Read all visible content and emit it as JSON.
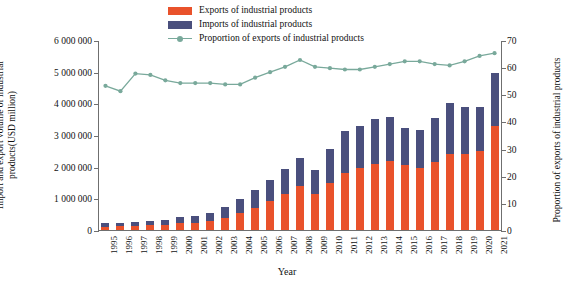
{
  "legend": {
    "items": [
      {
        "label": "Exports of industrial products",
        "type": "swatch",
        "color": "#e9522b"
      },
      {
        "label": "Imports of industrial products",
        "type": "swatch",
        "color": "#4a4f7d"
      },
      {
        "label": "Proportion of exports of industrial products",
        "type": "line",
        "color": "#79a99b"
      }
    ]
  },
  "axes": {
    "y_left_title": "Import and export volume of industrial products(USD million)",
    "y_right_title": "Proportion of exports of industrial products",
    "x_title": "Year",
    "y_left_ticks": [
      "0",
      "1 000 000",
      "2 000 000",
      "3 000 000",
      "4 000 000",
      "5 000 000",
      "6 000 000"
    ],
    "y_right_ticks": [
      "0",
      "10",
      "20",
      "30",
      "40",
      "50",
      "60",
      "70"
    ]
  },
  "chart_data": {
    "type": "bar",
    "title": "",
    "xlabel": "Year",
    "ylabel": "Import and export volume of industrial products(USD million)",
    "y2label": "Proportion of exports of industrial products",
    "ylim": [
      0,
      6000000
    ],
    "y2lim": [
      0,
      70
    ],
    "grid": false,
    "legend_position": "top-center",
    "categories": [
      "1995",
      "1996",
      "1997",
      "1998",
      "1999",
      "2000",
      "2001",
      "2002",
      "2003",
      "2004",
      "2005",
      "2006",
      "2007",
      "2008",
      "2009",
      "2010",
      "2011",
      "2012",
      "2013",
      "2014",
      "2015",
      "2016",
      "2017",
      "2018",
      "2019",
      "2020",
      "2021"
    ],
    "series": [
      {
        "name": "Exports of industrial products",
        "type": "bar-stack",
        "color": "#e9522b",
        "values": [
          110000,
          120000,
          140000,
          150000,
          160000,
          210000,
          230000,
          290000,
          390000,
          530000,
          700000,
          910000,
          1140000,
          1380000,
          1150000,
          1470000,
          1800000,
          1950000,
          2080000,
          2180000,
          2050000,
          1960000,
          2140000,
          2400000,
          2400000,
          2500000,
          3300000
        ]
      },
      {
        "name": "Imports of industrial products",
        "type": "bar-stack",
        "color": "#4a4f7d",
        "values": [
          110000,
          110000,
          110000,
          120000,
          150000,
          190000,
          200000,
          250000,
          340000,
          460000,
          550000,
          660000,
          790000,
          890000,
          740000,
          1090000,
          1330000,
          1340000,
          1430000,
          1400000,
          1160000,
          1200000,
          1400000,
          1600000,
          1490000,
          1400000,
          1670000
        ]
      },
      {
        "name": "Proportion of exports of industrial products",
        "type": "line",
        "color": "#79a99b",
        "axis": "right",
        "values": [
          53.5,
          51.5,
          58.0,
          57.5,
          55.5,
          54.5,
          54.5,
          54.5,
          54.0,
          54.0,
          56.5,
          58.5,
          60.5,
          63.0,
          60.5,
          60.0,
          59.5,
          59.5,
          60.5,
          61.5,
          62.5,
          62.5,
          61.5,
          61.0,
          62.5,
          64.5,
          65.5
        ]
      }
    ]
  }
}
